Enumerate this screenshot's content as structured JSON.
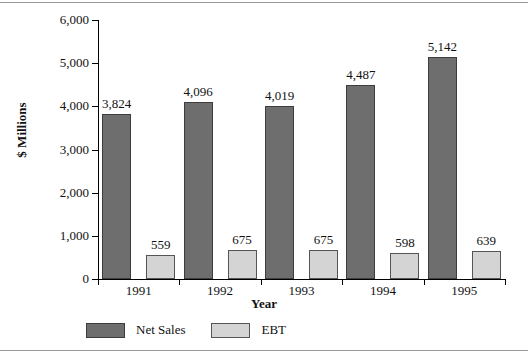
{
  "chart_data": {
    "type": "bar",
    "title": "",
    "xlabel": "Year",
    "ylabel": "$ Millions",
    "categories": [
      "1991",
      "1992",
      "1993",
      "1994",
      "1995"
    ],
    "ylim": [
      0,
      6000
    ],
    "yticks": [
      0,
      1000,
      2000,
      3000,
      4000,
      5000,
      6000
    ],
    "ytick_labels": [
      "0",
      "1,000",
      "2,000",
      "3,000",
      "4,000",
      "5,000",
      "6,000"
    ],
    "grid": false,
    "legend_position": "bottom",
    "series": [
      {
        "name": "Net Sales",
        "color": "#6e6e6e",
        "values": [
          3824,
          4096,
          4019,
          4487,
          5142
        ],
        "value_labels": [
          "3,824",
          "4,096",
          "4,019",
          "4,487",
          "5,142"
        ]
      },
      {
        "name": "EBT",
        "color": "#d4d4d4",
        "values": [
          559,
          675,
          675,
          598,
          639
        ],
        "value_labels": [
          "559",
          "675",
          "675",
          "598",
          "639"
        ]
      }
    ]
  }
}
